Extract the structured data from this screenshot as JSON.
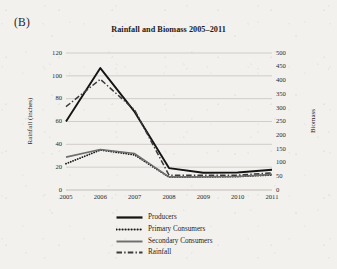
{
  "panel": {
    "label": "(B)"
  },
  "chart_data": {
    "type": "line",
    "title": "Rainfall and Biomass 2005–2011",
    "xlabel": "",
    "ylabel": "Rainfall (inches)",
    "ylabel_right": "Biomass",
    "grid": "horizontal",
    "legend_position": "bottom",
    "categories": [
      "2005",
      "2006",
      "2007",
      "2008",
      "2009",
      "2010",
      "2011"
    ],
    "x": [
      2005,
      2006,
      2007,
      2008,
      2009,
      2010,
      2011
    ],
    "ylim": [
      0,
      120
    ],
    "yticks": [
      0,
      20,
      40,
      60,
      80,
      100,
      120
    ],
    "ylim_right": [
      0,
      500
    ],
    "yticks_right": [
      0,
      50,
      100,
      150,
      200,
      250,
      300,
      350,
      400,
      450,
      500
    ],
    "series": [
      {
        "name": "Producers",
        "axis": "right",
        "style": "solid",
        "color": "#141414",
        "width": 1.9,
        "values": [
          250,
          445,
          285,
          80,
          63,
          64,
          74
        ]
      },
      {
        "name": "Primary Consumers",
        "axis": "right",
        "style": "dotted",
        "color": "#1a1a1a",
        "width": 1.8,
        "values": [
          96,
          146,
          128,
          47,
          48,
          49,
          55
        ]
      },
      {
        "name": "Secondary Consumers",
        "axis": "right",
        "style": "solid",
        "color": "#6e6e6e",
        "width": 1.6,
        "values": [
          120,
          148,
          133,
          48,
          48,
          49,
          57
        ]
      },
      {
        "name": "Rainfall",
        "axis": "left",
        "style": "dashdot",
        "color": "#3a3a3a",
        "width": 1.5,
        "values": [
          73,
          97,
          70,
          13,
          13,
          13,
          15
        ]
      }
    ]
  },
  "legend": {
    "items": [
      {
        "label": "Producers",
        "swatch": "solid-black-line-icon"
      },
      {
        "label": "Primary Consumers",
        "swatch": "dotted-line-icon"
      },
      {
        "label": "Secondary Consumers",
        "swatch": "solid-gray-line-icon"
      },
      {
        "label": "Rainfall",
        "swatch": "dash-dot-line-icon"
      }
    ]
  }
}
